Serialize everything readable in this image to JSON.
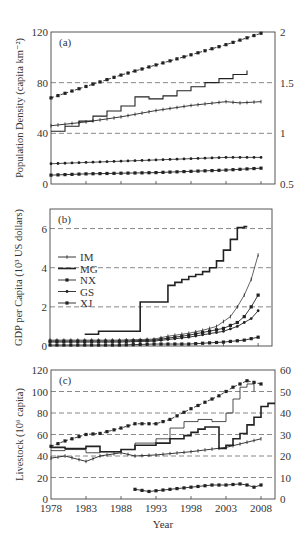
{
  "chart_data": [
    {
      "panel": "(a)",
      "type": "line",
      "title": "",
      "xlabel": "",
      "ylabel": "Population Density (capita km⁻²)",
      "ylabel_right": "",
      "xlim": [
        1978,
        2010
      ],
      "ylim": [
        0,
        120
      ],
      "ylim_right": [
        0.5,
        2
      ],
      "yticks": [
        0,
        40,
        80,
        120
      ],
      "yticks_right": [
        "0.5",
        "1",
        "1.5",
        "2"
      ],
      "xticks": [
        1978,
        1983,
        1988,
        1993,
        1998,
        2003,
        2008
      ],
      "grid": "dashed at 40 and 80",
      "series": [
        {
          "name": "NX",
          "style": "dashed-markers",
          "x": [
            1978,
            1983,
            1988,
            1993,
            1998,
            2003,
            2008
          ],
          "values": [
            68,
            77,
            86,
            94,
            102,
            110,
            119
          ]
        },
        {
          "name": "MG (right axis)",
          "style": "step",
          "axis": "right",
          "x": [
            1978,
            1980,
            1982,
            1984,
            1986,
            1988,
            1990,
            1992,
            1994,
            1996,
            1998,
            2000,
            2002,
            2004,
            2006
          ],
          "values": [
            1.02,
            1.07,
            1.12,
            1.17,
            1.22,
            1.27,
            1.36,
            1.34,
            1.37,
            1.42,
            1.46,
            1.5,
            1.54,
            1.58,
            1.62
          ]
        },
        {
          "name": "GS",
          "style": "line-markers",
          "x": [
            1978,
            1983,
            1988,
            1993,
            1998,
            2003,
            2005,
            2008
          ],
          "values": [
            46,
            49,
            53,
            58,
            62,
            65,
            64,
            65
          ]
        },
        {
          "name": "IM",
          "style": "line-small-markers",
          "x": [
            1978,
            1983,
            1988,
            1993,
            1998,
            2003,
            2008
          ],
          "values": [
            16,
            17,
            18,
            19,
            20,
            21,
            21
          ]
        },
        {
          "name": "XJ",
          "style": "line-markers",
          "x": [
            1978,
            1983,
            1988,
            1993,
            1998,
            2003,
            2008
          ],
          "values": [
            7,
            8,
            8.5,
            9,
            10,
            11,
            12.5
          ]
        }
      ]
    },
    {
      "panel": "(b)",
      "type": "line",
      "title": "",
      "xlabel": "",
      "ylabel": "GDP per Capita (10³ US dollars)",
      "xlim": [
        1978,
        2010
      ],
      "ylim": [
        0,
        7
      ],
      "yticks": [
        0,
        2,
        4,
        6
      ],
      "grid": "dashed at 2, 4, 6",
      "legend": [
        "IM",
        "MG",
        "NX",
        "GS",
        "XJ"
      ],
      "legend_position": "upper-left",
      "series": [
        {
          "name": "IM",
          "x": [
            1978,
            1983,
            1988,
            1993,
            1995,
            1998,
            2000,
            2002,
            2004,
            2005,
            2006,
            2007,
            2008
          ],
          "values": [
            0.3,
            0.3,
            0.3,
            0.35,
            0.5,
            0.65,
            0.8,
            1.0,
            1.5,
            2.0,
            2.6,
            3.4,
            4.65
          ]
        },
        {
          "name": "MG",
          "style": "step",
          "x": [
            1983,
            1985,
            1991,
            1995,
            1996,
            1997,
            1998,
            1999,
            2000,
            2001,
            2002,
            2003,
            2004,
            2005,
            2006
          ],
          "values": [
            0.6,
            0.75,
            2.25,
            3.1,
            3.25,
            3.4,
            3.55,
            3.65,
            3.8,
            4.0,
            4.35,
            4.9,
            5.45,
            6.05,
            6.1
          ]
        },
        {
          "name": "NX",
          "x": [
            1978,
            1983,
            1988,
            1993,
            1998,
            2003,
            2005,
            2006,
            2007,
            2008
          ],
          "values": [
            0.25,
            0.25,
            0.25,
            0.3,
            0.55,
            0.9,
            1.2,
            1.5,
            2.0,
            2.6
          ]
        },
        {
          "name": "GS",
          "x": [
            1978,
            1983,
            1988,
            1993,
            1998,
            2003,
            2005,
            2006,
            2007,
            2008
          ],
          "values": [
            0.2,
            0.2,
            0.2,
            0.25,
            0.45,
            0.75,
            1.0,
            1.2,
            1.4,
            1.8
          ]
        },
        {
          "name": "XJ",
          "x": [
            1978,
            1983,
            1988,
            1993,
            1998,
            2003,
            2006,
            2008
          ],
          "values": [
            0.05,
            0.05,
            0.05,
            0.1,
            0.1,
            0.2,
            0.3,
            0.45
          ]
        }
      ]
    },
    {
      "panel": "(c)",
      "type": "line",
      "title": "",
      "xlabel": "Year",
      "ylabel": "Livestock (10⁶ capita)",
      "xlim": [
        1978,
        2010
      ],
      "ylim": [
        0,
        120
      ],
      "ylim_right": [
        0,
        60
      ],
      "yticks": [
        0,
        20,
        40,
        60,
        80,
        100,
        120
      ],
      "yticks_right": [
        0,
        10,
        20,
        30,
        40,
        50,
        60
      ],
      "xticks": [
        1978,
        1983,
        1988,
        1993,
        1998,
        2003,
        2008
      ],
      "grid": "dashed at 20, 40, 60, 80, 100",
      "series": [
        {
          "name": "NX-dashed-markers",
          "x": [
            1978,
            1980,
            1983,
            1985,
            1988,
            1990,
            1993,
            1995,
            1998,
            2000,
            2002,
            2004,
            2006,
            2008
          ],
          "values": [
            49,
            54,
            60,
            61,
            66,
            70,
            70,
            74,
            84,
            90,
            96,
            104,
            110,
            107
          ]
        },
        {
          "name": "IM-thin-step",
          "style": "step",
          "x": [
            1978,
            1980,
            1983,
            1985,
            1988,
            1990,
            1993,
            1995,
            1997,
            1999,
            2001,
            2003,
            2004,
            2005,
            2006,
            2007
          ],
          "values": [
            45,
            46,
            43,
            44,
            46,
            52,
            56,
            66,
            72,
            74,
            72,
            80,
            93,
            104,
            107,
            100
          ]
        },
        {
          "name": "MG-thick-step (right)",
          "style": "step",
          "x": [
            1978,
            1980,
            1983,
            1985,
            1988,
            1990,
            1993,
            1995,
            1997,
            1998,
            1999,
            2000,
            2002,
            2003,
            2004,
            2005,
            2006,
            2007,
            2008,
            2009
          ],
          "values": [
            48,
            47,
            49,
            44,
            46,
            50,
            52,
            56,
            59,
            62,
            65,
            67,
            47,
            50,
            56,
            61,
            69,
            76,
            86,
            89
          ]
        },
        {
          "name": "GS-markers",
          "x": [
            1978,
            1980,
            1983,
            1985,
            1988,
            1990,
            1993,
            1998,
            2003,
            2008
          ],
          "values": [
            38,
            40,
            35,
            40,
            43,
            40,
            41,
            44,
            48,
            56
          ]
        },
        {
          "name": "XJ-markers",
          "x": [
            1990,
            1992,
            1995,
            1998,
            2001,
            2003,
            2005,
            2006,
            2007,
            2008
          ],
          "values": [
            9,
            7,
            9,
            11,
            13,
            13,
            14,
            13,
            11,
            13
          ]
        }
      ]
    }
  ],
  "panels": {
    "a": {
      "label": "(a)",
      "ylabel": "Population Density (capita km⁻²)",
      "left_ticks": [
        "120",
        "80",
        "40",
        "0"
      ],
      "right_ticks": [
        "2",
        "1.5",
        "1",
        "0.5"
      ]
    },
    "b": {
      "label": "(b)",
      "ylabel": "GDP per Capita (10³ US dollars)",
      "left_ticks": [
        "6",
        "4",
        "2",
        "0"
      ],
      "legend": [
        "IM",
        "MG",
        "NX",
        "GS",
        "XJ"
      ]
    },
    "c": {
      "label": "(c)",
      "ylabel": "Livestock (10⁶ capita)",
      "left_ticks": [
        "120",
        "100",
        "80",
        "60",
        "40",
        "20",
        "0"
      ],
      "right_ticks": [
        "60",
        "50",
        "40",
        "30",
        "20",
        "10",
        "0"
      ],
      "xlabel": "Year",
      "xticks": [
        "1978",
        "1983",
        "1988",
        "1993",
        "1998",
        "2003",
        "2008"
      ]
    }
  }
}
